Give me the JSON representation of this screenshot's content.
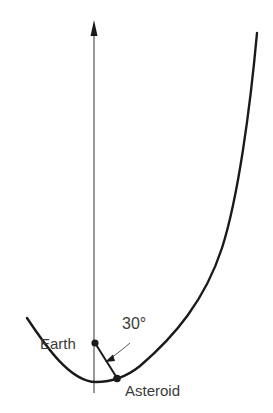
{
  "diagram": {
    "type": "orbital-geometry",
    "labels": {
      "earth": "Earth",
      "angle": "30°",
      "asteroid": "Asteroid"
    },
    "elements": {
      "axis": {
        "direction": "up",
        "arrow": true
      },
      "trajectory": {
        "shape": "parabola-like curve"
      },
      "earth_point": {
        "label": "Earth"
      },
      "asteroid_point": {
        "label": "Asteroid"
      },
      "connecting_line": {
        "from": "Earth",
        "to": "Asteroid",
        "angle_deg": 30
      }
    },
    "colors": {
      "stroke": "#1a1a1a",
      "axis": "#555555",
      "text": "#3a3a3a",
      "background": "#ffffff"
    }
  }
}
